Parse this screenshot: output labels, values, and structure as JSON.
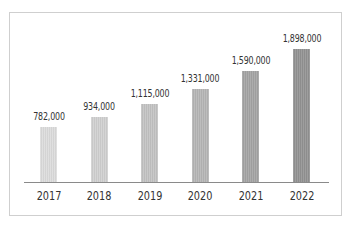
{
  "chart_data": {
    "type": "bar",
    "title": "",
    "xlabel": "",
    "ylabel": "",
    "categories": [
      "2017",
      "2018",
      "2019",
      "2020",
      "2021",
      "2022"
    ],
    "values": [
      782000,
      934000,
      1115000,
      1331000,
      1590000,
      1898000
    ],
    "value_labels": [
      "782,000",
      "934,000",
      "1,115,000",
      "1,331,000",
      "1,590,000",
      "1,898,000"
    ],
    "bar_colors": [
      "#dcdcdc",
      "#d0d0d0",
      "#c3c3c3",
      "#b6b6b6",
      "#a4a4a4",
      "#939393"
    ],
    "ylim": [
      0,
      1900000
    ],
    "grid": false,
    "legend": null
  }
}
